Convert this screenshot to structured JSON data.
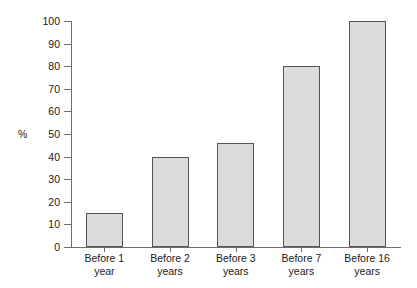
{
  "chart_data": {
    "type": "bar",
    "title": "",
    "subtitle": "",
    "xlabel": "",
    "ylabel": "%",
    "ylim": [
      0,
      100
    ],
    "yticks": [
      0,
      10,
      20,
      30,
      40,
      50,
      60,
      70,
      80,
      90,
      100
    ],
    "ytick_labels": [
      "0",
      "10",
      "20",
      "30",
      "40",
      "50",
      "60",
      "70",
      "80",
      "90",
      "100"
    ],
    "grid": false,
    "legend": "none",
    "categories": [
      "Before 1 year",
      "Before 2 years",
      "Before 3 years",
      "Before 7 years",
      "Before 16 years"
    ],
    "category_lines": [
      {
        "line1": "Before 1",
        "line2": "year"
      },
      {
        "line1": "Before 2",
        "line2": "years"
      },
      {
        "line1": "Before 3",
        "line2": "years"
      },
      {
        "line1": "Before 7",
        "line2": "years"
      },
      {
        "line1": "Before 16",
        "line2": "years"
      }
    ],
    "values": [
      15,
      40,
      46,
      80,
      100
    ],
    "bar_fill_color": "#dcdcdc",
    "bar_edge_color": "#555555",
    "axis_color": "#6e6e6e",
    "background_color": "#ffffff",
    "text_color": "#1a1a1a"
  }
}
